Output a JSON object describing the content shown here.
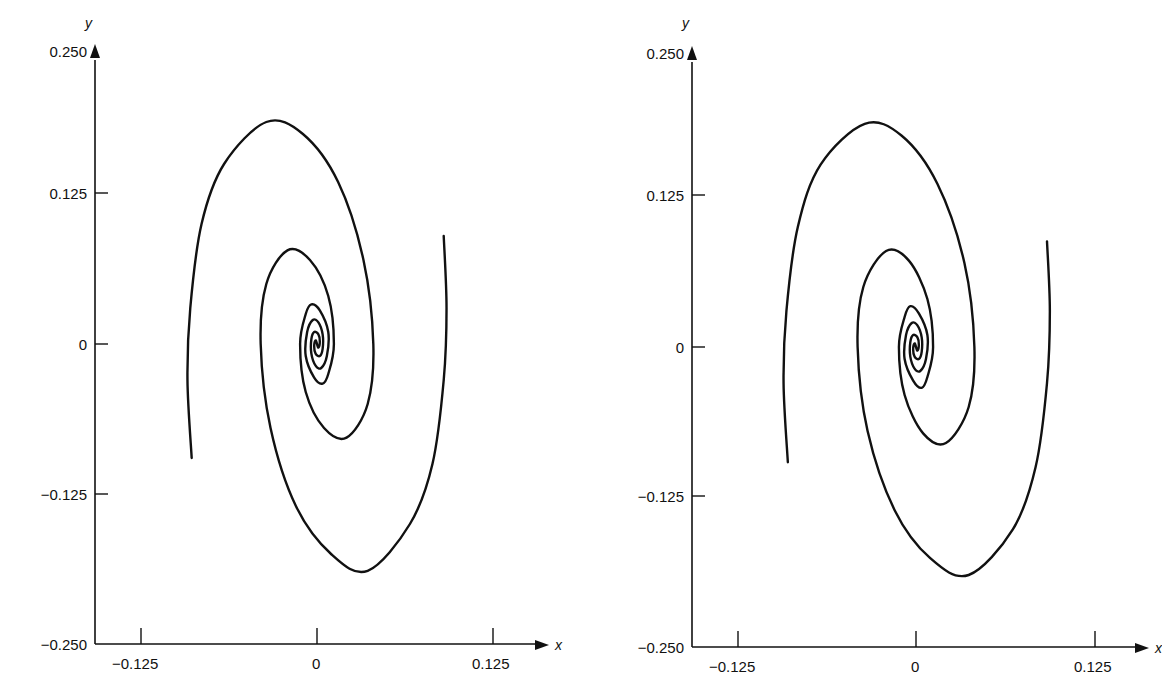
{
  "chart_data": [
    {
      "type": "line",
      "title": "",
      "xlabel": "x",
      "ylabel": "y",
      "xlim": [
        -0.15,
        0.15
      ],
      "ylim": [
        -0.25,
        0.25
      ],
      "grid": false,
      "legend": null,
      "x_ticks": [
        "-0.125",
        "0",
        "0.125"
      ],
      "y_ticks": [
        "0.250",
        "0.125",
        "0",
        "-0.125",
        "-0.250"
      ],
      "series": [
        {
          "name": "trajectory-1",
          "x": [
            0.09,
            0.092,
            0.09,
            0.082,
            0.066,
            0.036,
            0.01,
            -0.015,
            -0.033,
            -0.04,
            -0.036,
            -0.021,
            -0.005,
            0.008,
            0.012,
            0.008,
            0.004,
            -0.002,
            -0.008,
            -0.007,
            -0.003,
            0.001,
            0.004,
            0.004,
            0.002,
            -0.001,
            -0.002,
            -0.001,
            0.0
          ],
          "y": [
            0.09,
            0.03,
            -0.03,
            -0.1,
            -0.15,
            -0.189,
            -0.175,
            -0.135,
            -0.07,
            0.0,
            0.05,
            0.078,
            0.07,
            0.04,
            0.0,
            -0.025,
            -0.033,
            -0.028,
            -0.01,
            0.01,
            0.02,
            0.018,
            0.008,
            -0.004,
            -0.01,
            -0.008,
            -0.002,
            0.003,
            0.0
          ]
        },
        {
          "name": "trajectory-2",
          "x": [
            -0.089,
            -0.092,
            -0.09,
            -0.082,
            -0.066,
            -0.036,
            -0.01,
            0.015,
            0.033,
            0.04,
            0.036,
            0.021,
            0.005,
            -0.008,
            -0.012,
            -0.008,
            -0.004,
            0.002,
            0.008,
            0.007,
            0.003,
            -0.001,
            -0.004,
            -0.004,
            -0.002,
            0.001,
            0.002,
            0.001,
            0.0
          ],
          "y": [
            -0.095,
            -0.03,
            0.03,
            0.1,
            0.15,
            0.185,
            0.175,
            0.135,
            0.07,
            0.0,
            -0.05,
            -0.078,
            -0.07,
            -0.04,
            0.0,
            0.025,
            0.033,
            0.028,
            0.01,
            -0.01,
            -0.02,
            -0.018,
            -0.008,
            0.004,
            0.01,
            0.008,
            0.002,
            -0.003,
            0.0
          ]
        }
      ]
    },
    {
      "type": "line",
      "title": "",
      "xlabel": "x",
      "ylabel": "y",
      "xlim": [
        -0.15,
        0.15
      ],
      "ylim": [
        -0.25,
        0.25
      ],
      "grid": false,
      "legend": null,
      "x_ticks": [
        "-0.125",
        "0",
        "0.125"
      ],
      "y_ticks": [
        "0.250",
        "0.125",
        "0",
        "-0.125",
        "-0.250"
      ],
      "series": [
        {
          "name": "trajectory-1",
          "x": [
            0.092,
            0.094,
            0.092,
            0.084,
            0.068,
            0.037,
            0.01,
            -0.015,
            -0.034,
            -0.041,
            -0.037,
            -0.021,
            -0.005,
            0.008,
            0.012,
            0.008,
            0.004,
            -0.002,
            -0.008,
            -0.007,
            -0.003,
            0.001,
            0.004,
            0.004,
            0.002,
            -0.001,
            -0.002,
            -0.001,
            0.0
          ],
          "y": [
            0.088,
            0.03,
            -0.03,
            -0.1,
            -0.152,
            -0.19,
            -0.176,
            -0.136,
            -0.07,
            0.0,
            0.05,
            0.08,
            0.072,
            0.04,
            0.0,
            -0.025,
            -0.034,
            -0.028,
            -0.01,
            0.01,
            0.02,
            0.018,
            0.008,
            -0.004,
            -0.01,
            -0.008,
            -0.002,
            0.003,
            0.0
          ]
        },
        {
          "name": "trajectory-2",
          "x": [
            -0.09,
            -0.093,
            -0.091,
            -0.083,
            -0.067,
            -0.036,
            -0.01,
            0.015,
            0.034,
            0.041,
            0.037,
            0.021,
            0.005,
            -0.008,
            -0.012,
            -0.008,
            -0.004,
            0.002,
            0.008,
            0.007,
            0.003,
            -0.001,
            -0.004,
            -0.004,
            -0.002,
            0.001,
            0.002,
            0.001,
            0.0
          ],
          "y": [
            -0.096,
            -0.03,
            0.03,
            0.1,
            0.152,
            0.186,
            0.176,
            0.136,
            0.07,
            0.0,
            -0.05,
            -0.08,
            -0.072,
            -0.04,
            0.0,
            0.025,
            0.034,
            0.028,
            0.01,
            -0.01,
            -0.02,
            -0.018,
            -0.008,
            0.004,
            0.01,
            0.008,
            0.002,
            -0.003,
            0.0
          ]
        }
      ]
    }
  ],
  "panels": [
    {
      "axes": {
        "x_name": "x",
        "y_name": "y"
      },
      "x_tick_labels": [
        "−0.125",
        "0",
        "0.125"
      ],
      "y_tick_labels": [
        "0.250",
        "0.125",
        "0",
        "−0.125",
        "−0.250"
      ]
    },
    {
      "axes": {
        "x_name": "x",
        "y_name": "y"
      },
      "x_tick_labels": [
        "−0.125",
        "0",
        "0.125"
      ],
      "y_tick_labels": [
        "0.250",
        "0.125",
        "0",
        "−0.125",
        "−0.250"
      ]
    }
  ],
  "style": {
    "line_color": "#111111",
    "axis_color": "#111111"
  }
}
